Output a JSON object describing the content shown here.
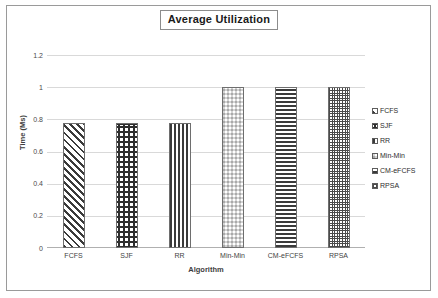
{
  "chart_data": {
    "type": "bar",
    "title": "Average Utilization",
    "xlabel": "Algorithm",
    "ylabel": "Time (Ms)",
    "categories": [
      "FCFS",
      "SJF",
      "RR",
      "Min-Min",
      "CM-eFCFS",
      "RPSA"
    ],
    "values": [
      0.78,
      0.775,
      0.78,
      1.0,
      1.0,
      1.0
    ],
    "ylim": [
      0,
      1.2
    ],
    "yticks": [
      "0",
      "0.2",
      "0.4",
      "0.6",
      "0.8",
      "1",
      "1.2"
    ],
    "ytick_values": [
      0,
      0.2,
      0.4,
      0.6,
      0.8,
      1,
      1.2
    ],
    "grid": true,
    "legend_position": "right",
    "legend": [
      {
        "label": "FCFS",
        "pattern": "diagonal-stripes"
      },
      {
        "label": "SJF",
        "pattern": "cross-hatch-dots"
      },
      {
        "label": "RR",
        "pattern": "vertical-stripes"
      },
      {
        "label": "Min-Min",
        "pattern": "checkerboard"
      },
      {
        "label": "CM-eFCFS",
        "pattern": "horizontal-stripes"
      },
      {
        "label": "RPSA",
        "pattern": "fine-grid"
      }
    ],
    "series": [
      {
        "name": "Average Utilization",
        "values": [
          0.78,
          0.775,
          0.78,
          1.0,
          1.0,
          1.0
        ]
      }
    ]
  },
  "colors": {
    "frame_border": "#9a9a9a",
    "gridline": "#d9d9d9",
    "bar_outline": "#6e6e6e",
    "pattern_ink": "#3a3a3a",
    "text": "#3d3d3d",
    "background": "#ffffff"
  }
}
